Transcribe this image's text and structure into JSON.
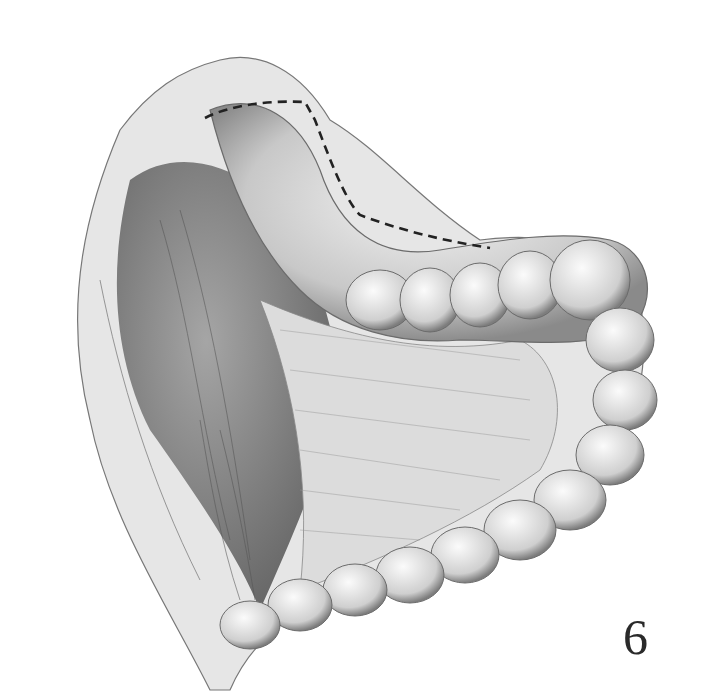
{
  "figure": {
    "number_label": "6",
    "colors": {
      "background": "#ffffff",
      "ink": "#2a2a2a",
      "shade_dark": "#6b6b6b",
      "shade_mid": "#a8a8a8",
      "shade_light": "#d8d8d8"
    }
  }
}
